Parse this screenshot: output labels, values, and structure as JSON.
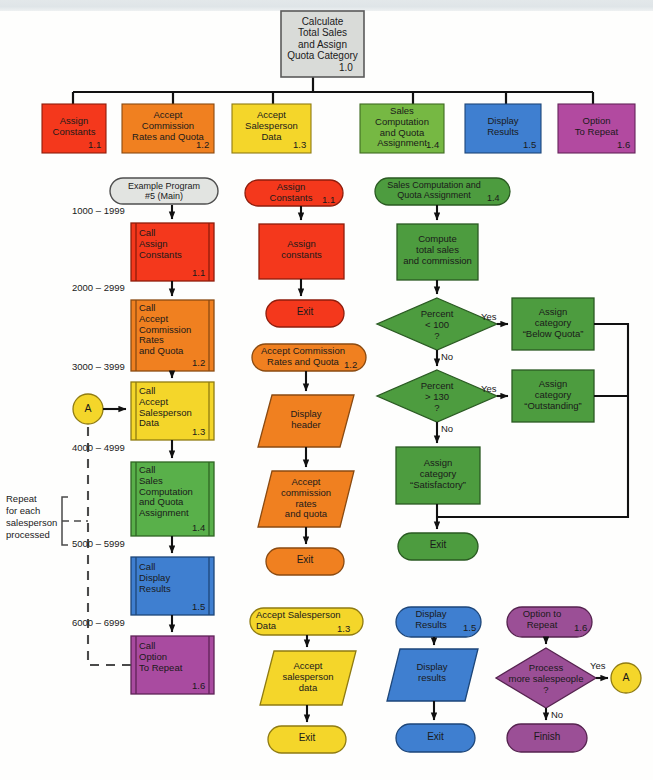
{
  "diagram": {
    "title_node": {
      "label": "Calculate\nTotal Sales\nand Assign\nQuota Category",
      "ref": "1.0",
      "color": "#d9dbd8"
    },
    "modules": [
      {
        "label": "Assign\nConstants",
        "ref": "1.1",
        "color": "#f4381c"
      },
      {
        "label": "Accept\nCommission\nRates and Quota",
        "ref": "1.2",
        "color": "#f08020"
      },
      {
        "label": "Accept\nSalesperson\nData",
        "ref": "1.3",
        "color": "#f4d62a"
      },
      {
        "label": "Sales\nComputation\nand Quota\nAssignment",
        "ref": "1.4",
        "color": "#76b843"
      },
      {
        "label": "Display\nResults",
        "ref": "1.5",
        "color": "#3f7fd0"
      },
      {
        "label": "Option\nTo Repeat",
        "ref": "1.6",
        "color": "#b24aa0"
      }
    ],
    "main_program": {
      "terminal": {
        "label": "Example Program\n#5 (Main)",
        "color": "#e2e4e1"
      },
      "note": "Repeat\nfor each\nsalesperson\nprocessed",
      "connector_a": "A",
      "steps": [
        {
          "range": "1000 – 1999",
          "label": "Call\nAssign\nConstants",
          "ref": "1.1",
          "color": "#f4381c"
        },
        {
          "range": "2000 – 2999",
          "label": "Call\nAccept\nCommission\nRates\nand Quota",
          "ref": "1.2",
          "color": "#f08020"
        },
        {
          "range": "3000 – 3999",
          "label": "Call\nAccept\nSalesperson\nData",
          "ref": "1.3",
          "color": "#f4d62a"
        },
        {
          "range": "4000 – 4999",
          "label": "Call\nSales\nComputation\nand Quota\nAssignment",
          "ref": "1.4",
          "color": "#76b843"
        },
        {
          "range": "5000 – 5999",
          "label": "Call\nDisplay\nResults",
          "ref": "1.5",
          "color": "#3f7fd0"
        },
        {
          "range": "6000 – 6999",
          "label": "Call\nOption\nTo Repeat",
          "ref": "1.6",
          "color": "#b24aa0"
        }
      ]
    },
    "sub_assign_constants": {
      "color": "#f4381c",
      "start": {
        "label": "Assign\nConstants",
        "ref": "1.1"
      },
      "process": "Assign\nconstants",
      "exit": "Exit"
    },
    "sub_accept_commission": {
      "color": "#f08020",
      "start": {
        "label": "Accept Commission\nRates and Quota",
        "ref": "1.2"
      },
      "io_header": "Display\nheader",
      "io_accept": "Accept\ncommission\nrates\nand quota",
      "exit": "Exit"
    },
    "sub_accept_salesperson": {
      "color": "#f4d62a",
      "start": {
        "label": "Accept Salesperson\nData",
        "ref": "1.3"
      },
      "io_accept": "Accept\nsalesperson\ndata",
      "exit": "Exit"
    },
    "sub_sales_computation": {
      "color": "#4d9c3f",
      "start": {
        "label": "Sales Computation and\nQuota Assignment",
        "ref": "1.4"
      },
      "process": "Compute\ntotal sales\nand commission",
      "decision_1": "Percent\n< 100\n?",
      "decision_1_yes": "Yes",
      "decision_1_no": "No",
      "assign_below": "Assign\ncategory\n“Below Quota”",
      "decision_2": "Percent\n> 130\n?",
      "decision_2_yes": "Yes",
      "decision_2_no": "No",
      "assign_outstanding": "Assign\ncategory\n“Outstanding”",
      "assign_satisfactory": "Assign\ncategory\n“Satisfactory”",
      "exit": "Exit"
    },
    "sub_display_results": {
      "color": "#3f7fd0",
      "start": {
        "label": "Display\nResults",
        "ref": "1.5"
      },
      "io_display": "Display\nresults",
      "exit": "Exit"
    },
    "sub_option_repeat": {
      "color": "#9b4f96",
      "start": {
        "label": "Option to\nRepeat",
        "ref": "1.6"
      },
      "decision": "Process\nmore salespeople\n?",
      "decision_yes": "Yes",
      "decision_no": "No",
      "connector_a": "A",
      "finish": "Finish"
    }
  }
}
